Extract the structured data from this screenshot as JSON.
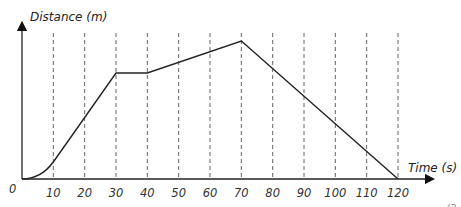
{
  "chart_data": {
    "type": "line",
    "title": "",
    "xlabel": "Time (s)",
    "ylabel": "Distance (m)",
    "origin_label": "0",
    "x_ticks": [
      10,
      20,
      30,
      40,
      50,
      60,
      70,
      80,
      90,
      100,
      110,
      120
    ],
    "x_tick_labels": [
      "10",
      "20",
      "30",
      "40",
      "50",
      "60",
      "70",
      "80",
      "90",
      "100",
      "110",
      "120"
    ],
    "xlim": [
      0,
      120
    ],
    "y_ticks": [],
    "grid": {
      "vertical_dashed": true,
      "horizontal": false
    },
    "series": [
      {
        "name": "Distance vs Time",
        "note": "Distance values are relative (no y-axis scale shown); estimated from pixel heights above the x-axis.",
        "points": [
          {
            "x": 0,
            "y": 0
          },
          {
            "x": 5,
            "y": 5
          },
          {
            "x": 10,
            "y": 17
          },
          {
            "x": 30,
            "y": 106
          },
          {
            "x": 40,
            "y": 106
          },
          {
            "x": 70,
            "y": 138
          },
          {
            "x": 120,
            "y": 0
          }
        ],
        "segments": [
          {
            "from": 0,
            "to": 10,
            "shape": "curve (accelerating)"
          },
          {
            "from": 10,
            "to": 30,
            "shape": "straight, steep"
          },
          {
            "from": 30,
            "to": 40,
            "shape": "flat (stationary)"
          },
          {
            "from": 40,
            "to": 70,
            "shape": "straight, gentle"
          },
          {
            "from": 70,
            "to": 120,
            "shape": "straight, returning to zero"
          }
        ]
      }
    ],
    "corner_fragment": "(3"
  }
}
